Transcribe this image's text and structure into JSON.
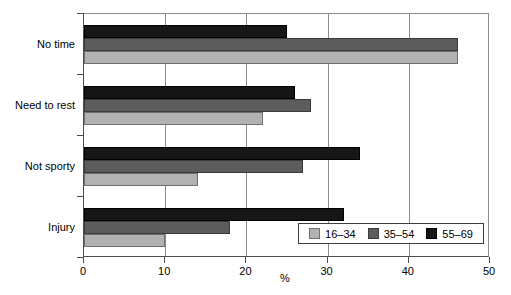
{
  "chart_data": {
    "type": "bar",
    "orientation": "horizontal",
    "title": "",
    "xlabel": "%",
    "ylabel": "",
    "xlim": [
      0,
      50
    ],
    "xticks": [
      0,
      10,
      20,
      30,
      40,
      50
    ],
    "xtick_labels": [
      "0",
      "10",
      "20",
      "30",
      "40",
      "50"
    ],
    "grid": true,
    "grid_axis": "x",
    "legend_position": "inside-bottom-right",
    "categories": [
      "No time",
      "Need to rest",
      "Not sporty",
      "Injury"
    ],
    "series": [
      {
        "name": "16–34",
        "color": "#b2b2b2",
        "values": [
          46,
          22,
          14,
          10
        ]
      },
      {
        "name": "35–54",
        "color": "#5c5c5c",
        "values": [
          46,
          28,
          27,
          18
        ]
      },
      {
        "name": "55–69",
        "color": "#161616",
        "values": [
          25,
          26,
          34,
          32
        ]
      }
    ]
  },
  "legend": {
    "items": [
      {
        "label": "16–34"
      },
      {
        "label": "35–54"
      },
      {
        "label": "55–69"
      }
    ]
  },
  "axes": {
    "x_title": "%",
    "x_tick_labels": [
      "0",
      "10",
      "20",
      "30",
      "40",
      "50"
    ],
    "y_tick_labels": [
      "No time",
      "Need to rest",
      "Not sporty",
      "Injury"
    ]
  },
  "colors": {
    "series_16_34": "#b2b2b2",
    "series_35_54": "#5c5c5c",
    "series_55_69": "#161616",
    "axis": "#4d4d4d",
    "grid": "#8c8c8c",
    "background": "#ffffff"
  }
}
